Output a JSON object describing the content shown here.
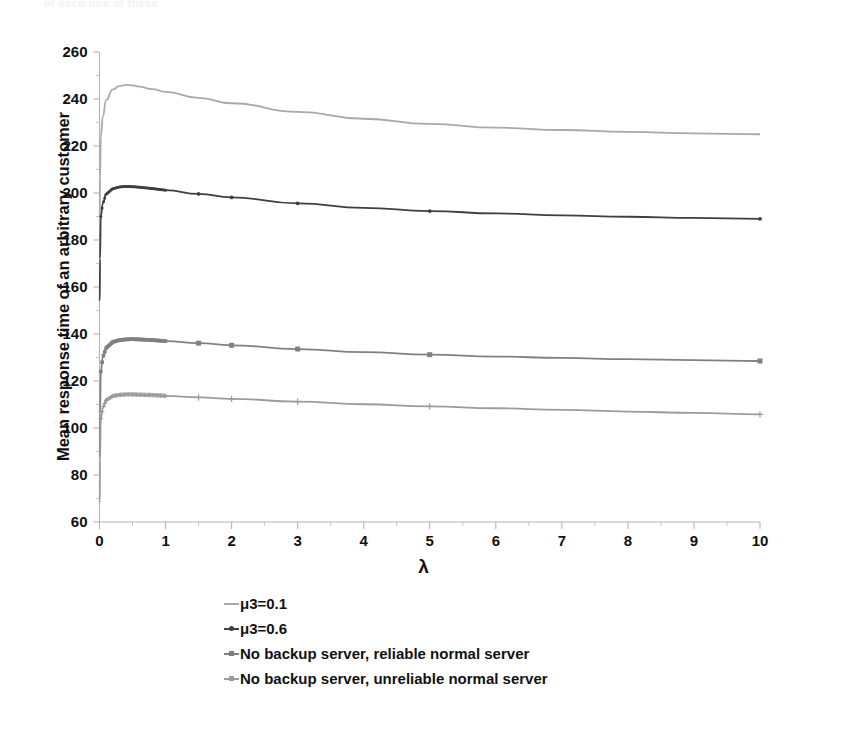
{
  "figure": {
    "ghost_header_text": "of each one of these",
    "background": "#ffffff"
  },
  "chart_data": {
    "type": "line",
    "title": "",
    "xlabel": "λ",
    "ylabel": "Mean response time of an arbitrary customer",
    "xlim": [
      0,
      10
    ],
    "ylim": [
      60,
      260
    ],
    "xticks": [
      "0",
      "1",
      "2",
      "3",
      "4",
      "5",
      "6",
      "7",
      "8",
      "9",
      "10"
    ],
    "yticks": [
      "60",
      "80",
      "100",
      "120",
      "140",
      "160",
      "180",
      "200",
      "220",
      "240",
      "260"
    ],
    "minor_tick_interval": 0.5,
    "grid": false,
    "legend_position": "below-left",
    "x": [
      0.02,
      0.05,
      0.1,
      0.2,
      0.3,
      0.4,
      0.5,
      0.6,
      0.8,
      1.0,
      1.5,
      2.0,
      3.0,
      4.0,
      5.0,
      6.0,
      7.0,
      8.0,
      9.0,
      10.0
    ],
    "series": [
      {
        "name": "μ3=0.1",
        "color": "#a9a9a9",
        "marker": "none",
        "legend_key": "line-light-gray",
        "values": [
          224.0,
          232.5,
          239.5,
          244.0,
          245.5,
          246.0,
          245.8,
          245.3,
          244.2,
          243.0,
          240.5,
          238.2,
          234.5,
          231.6,
          229.4,
          227.8,
          226.8,
          226.0,
          225.4,
          225.0
        ]
      },
      {
        "name": "μ3=0.6",
        "color": "#3f3f3f",
        "marker": "dot",
        "legend_key": "line-dark-dot",
        "values": [
          190.0,
          195.5,
          199.5,
          201.8,
          202.6,
          202.8,
          202.7,
          202.5,
          201.9,
          201.2,
          199.6,
          198.1,
          195.6,
          193.7,
          192.3,
          191.3,
          190.5,
          189.9,
          189.4,
          189.0
        ]
      },
      {
        "name": "No backup server, reliable normal server",
        "color": "#808080",
        "marker": "square",
        "legend_key": "line-gray-square",
        "values": [
          124.0,
          130.0,
          134.0,
          136.6,
          137.4,
          137.7,
          137.8,
          137.7,
          137.4,
          137.0,
          136.1,
          135.2,
          133.6,
          132.3,
          131.2,
          130.4,
          129.8,
          129.3,
          128.9,
          128.5
        ]
      },
      {
        "name": "No backup server, unreliable normal server",
        "color": "#9b9b9b",
        "marker": "plus",
        "legend_key": "line-lightgray-plus",
        "values": [
          104.0,
          108.5,
          111.8,
          113.6,
          114.1,
          114.3,
          114.3,
          114.2,
          114.0,
          113.7,
          113.0,
          112.4,
          111.2,
          110.1,
          109.2,
          108.4,
          107.7,
          107.0,
          106.4,
          105.8
        ]
      }
    ]
  }
}
